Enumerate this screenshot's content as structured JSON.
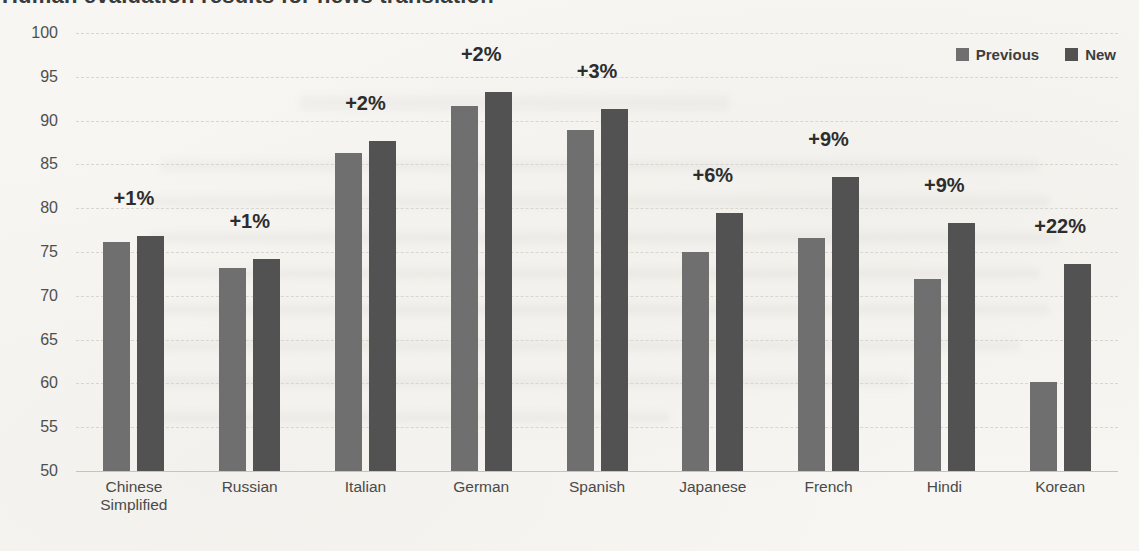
{
  "page": {
    "background_hex": "#f7f6f2",
    "title_clipped_at_top": "Human evaluation results for news translation"
  },
  "chart_data": {
    "type": "bar",
    "title": "Human evaluation results for news translation",
    "xlabel": "",
    "ylabel": "",
    "ylim": [
      50,
      100
    ],
    "yticks": [
      50,
      55,
      60,
      65,
      70,
      75,
      80,
      85,
      90,
      95,
      100
    ],
    "grid": true,
    "legend_position": "top-right",
    "categories": [
      "Chinese Simplified",
      "Russian",
      "Italian",
      "German",
      "Spanish",
      "Japanese",
      "French",
      "Hindi",
      "Korean"
    ],
    "series": [
      {
        "name": "Previous",
        "color": "#6f6f6f",
        "values": [
          76.1,
          73.2,
          86.3,
          91.7,
          88.9,
          75.0,
          76.6,
          71.9,
          60.2
        ]
      },
      {
        "name": "New",
        "color": "#525252",
        "values": [
          76.8,
          74.2,
          87.7,
          93.3,
          91.3,
          79.5,
          83.6,
          78.3,
          73.6
        ]
      }
    ],
    "annotations": [
      "+1%",
      "+1%",
      "+2%",
      "+2%",
      "+3%",
      "+6%",
      "+9%",
      "+9%",
      "+22%"
    ]
  }
}
